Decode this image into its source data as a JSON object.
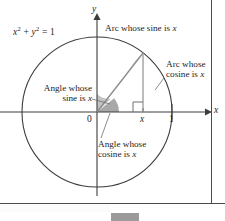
{
  "figure": {
    "equation": {
      "base1": "x",
      "exp1": "2",
      "plus": " + ",
      "base2": "y",
      "exp2": "2",
      "equals": " = 1",
      "full": "x2 + y2 = 1"
    },
    "axes": {
      "y_label": "y",
      "x_label": "x",
      "x_ticks": [
        {
          "name": "origin",
          "label": "0",
          "value": 0
        },
        {
          "name": "x-point",
          "label": "x",
          "value": 0.61
        },
        {
          "name": "unit",
          "label": "1",
          "value": 1
        }
      ]
    },
    "annotations": {
      "arc_sine": {
        "line1": "Arc whose sine is ",
        "line1_italic": "x",
        "full": "Arc whose sine is x"
      },
      "arc_cosine": {
        "line1": "Arc whose",
        "line2": "cosine is ",
        "line2_italic": "x",
        "full": "Arc whose cosine is x"
      },
      "angle_sine": {
        "line1": "Angle whose",
        "line2": "sine is ",
        "line2_italic": "x",
        "full": "Angle whose sine is x"
      },
      "angle_cosine": {
        "line1": "Angle whose",
        "line2": "cosine is ",
        "line2_italic": "x",
        "full": "Angle whose cosine is x"
      }
    },
    "colors": {
      "stroke": "#3c3c3c",
      "thin_stroke": "#7d7d7d",
      "wedge_light": "#c9c9c9",
      "wedge_dark": "#a8a8a8",
      "arc_shade": "#cccccc",
      "text": "#1d1d1d",
      "frame": "#4a4a4a",
      "tab": "#9b9b9b"
    },
    "geometry": {
      "center_x": 97,
      "center_y": 112,
      "radius": 75,
      "point_on_circle_x": 143,
      "point_on_circle_y": 53
    }
  }
}
